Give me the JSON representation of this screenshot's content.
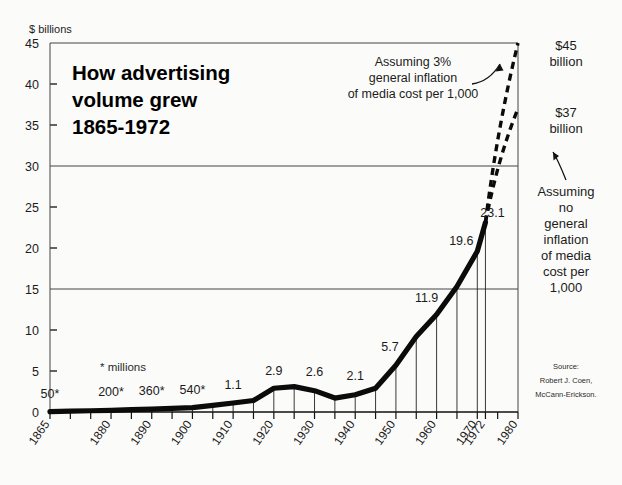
{
  "title": {
    "line1": "How advertising",
    "line2": "volume grew",
    "line3": "1865-1972"
  },
  "axis": {
    "y_unit_label": "$ billions",
    "y_ticks": [
      "0",
      "5",
      "10",
      "15",
      "20",
      "25",
      "30",
      "35",
      "40",
      "45"
    ],
    "x_ticks": [
      "1865",
      "1880",
      "1890",
      "1900",
      "1910",
      "1920",
      "1930",
      "1940",
      "1950",
      "1960",
      "1970",
      "1972",
      "1980"
    ]
  },
  "footnote": "* millions",
  "annotations": {
    "inflation_note_l1": "Assuming 3%",
    "inflation_note_l2": "general inflation",
    "inflation_note_l3": "of media cost per 1,000",
    "top_value_l1": "$45",
    "top_value_l2": "billion",
    "second_value_l1": "$37",
    "second_value_l2": "billion",
    "no_inflation_l1": "Assuming",
    "no_inflation_l2": "no",
    "no_inflation_l3": "general",
    "no_inflation_l4": "inflation",
    "no_inflation_l5": "of media",
    "no_inflation_l6": "cost per",
    "no_inflation_l7": "1,000"
  },
  "source": {
    "line1": "Source:",
    "line2": "Robert J. Coen,",
    "line3": "McCann-Erickson."
  },
  "colors": {
    "ink": "#111111",
    "grid": "#555555",
    "background": "#fbfbfa"
  },
  "chart_data": {
    "type": "line",
    "xlabel": "",
    "ylabel": "$ billions",
    "xlim": [
      1865,
      1980
    ],
    "ylim": [
      0,
      45
    ],
    "grid": "horizontal gridlines at 15, 30, 45; short ticks at 5,10,20,25,35,40",
    "legend": "none",
    "x": [
      1865,
      1870,
      1875,
      1880,
      1885,
      1890,
      1895,
      1900,
      1905,
      1910,
      1915,
      1920,
      1925,
      1930,
      1935,
      1940,
      1945,
      1950,
      1955,
      1960,
      1965,
      1970,
      1972
    ],
    "values": [
      0.05,
      0.1,
      0.15,
      0.2,
      0.28,
      0.36,
      0.45,
      0.54,
      0.8,
      1.1,
      1.4,
      2.9,
      3.1,
      2.6,
      1.7,
      2.1,
      2.9,
      5.7,
      9.2,
      11.9,
      15.3,
      19.6,
      23.1
    ],
    "point_labels": [
      {
        "x": 1865,
        "label": "50*",
        "value": 0.05
      },
      {
        "x": 1880,
        "label": "200*",
        "value": 0.2
      },
      {
        "x": 1890,
        "label": "360*",
        "value": 0.36
      },
      {
        "x": 1900,
        "label": "540*",
        "value": 0.54
      },
      {
        "x": 1910,
        "label": "1.1",
        "value": 1.1
      },
      {
        "x": 1920,
        "label": "2.9",
        "value": 2.9
      },
      {
        "x": 1930,
        "label": "2.6",
        "value": 2.6
      },
      {
        "x": 1940,
        "label": "2.1",
        "value": 2.1
      },
      {
        "x": 1950,
        "label": "5.7",
        "value": 5.7
      },
      {
        "x": 1960,
        "label": "11.9",
        "value": 11.9
      },
      {
        "x": 1970,
        "label": "19.6",
        "value": 19.6
      },
      {
        "x": 1972,
        "label": "23.1",
        "value": 23.1
      }
    ],
    "projections": [
      {
        "name": "Assuming 3% general inflation of media cost per 1,000",
        "from": [
          1972,
          23.1
        ],
        "to": [
          1980,
          45
        ],
        "style": "dashed"
      },
      {
        "name": "Assuming no general inflation of media cost per 1,000",
        "from": [
          1972,
          23.1
        ],
        "to": [
          1980,
          37
        ],
        "style": "dashed"
      }
    ]
  }
}
